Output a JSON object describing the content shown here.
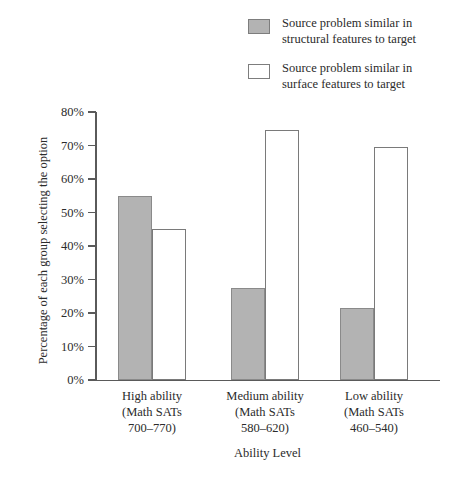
{
  "chart_data": {
    "type": "bar",
    "title": "",
    "xlabel": "Ability Level",
    "ylabel": "Percentage of each group selecting the option",
    "ylim": [
      0,
      80
    ],
    "ytick_labels": [
      "0%",
      "10%",
      "20%",
      "30%",
      "40%",
      "50%",
      "60%",
      "70%",
      "80%"
    ],
    "ytick_values": [
      0,
      10,
      20,
      30,
      40,
      50,
      60,
      70,
      80
    ],
    "grid": false,
    "legend_position": "top-right",
    "categories": [
      "High ability\n(Math SATs\n700–770)",
      "Medium ability\n(Math SATs\n580–620)",
      "Low ability\n(Math SATs\n460–540)"
    ],
    "series": [
      {
        "name": "Source problem similar in\nstructural features to target",
        "color": "#b3b3b3",
        "values": [
          55,
          27.5,
          21.5
        ]
      },
      {
        "name": "Source problem similar in\nsurface features to target",
        "color": "#ffffff",
        "values": [
          45,
          74.5,
          69.5
        ]
      }
    ]
  }
}
